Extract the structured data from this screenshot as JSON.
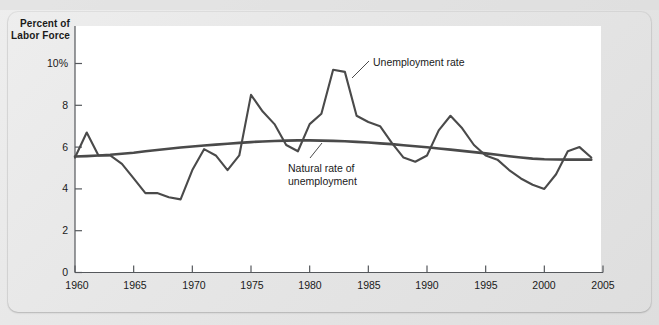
{
  "figure": {
    "axis_title_line1": "Percent of",
    "axis_title_line2": "Labor Force",
    "accent_line_color": "#4a4a4a",
    "panel_color": "#ffffff",
    "page_color": "#e9e9e9"
  },
  "labels": {
    "unemployment_rate": "Unemployment rate",
    "natural_rate": "Natural rate of\nunemployment"
  },
  "chart_data": {
    "type": "line",
    "title": "",
    "subtitle": "",
    "xlabel": "",
    "ylabel": "Percent of Labor Force",
    "xlim": [
      1960,
      2005
    ],
    "ylim": [
      0,
      10.8
    ],
    "grid": false,
    "legend": "inline-annotations",
    "ytick_labels": [
      "0",
      "2",
      "4",
      "6",
      "8",
      "10%"
    ],
    "ytick_values": [
      0,
      2,
      4,
      6,
      8,
      10
    ],
    "xtick_labels": [
      "1960",
      "1965",
      "1970",
      "1975",
      "1980",
      "1985",
      "1990",
      "1995",
      "2000",
      "2005"
    ],
    "xtick_values": [
      1960,
      1965,
      1970,
      1975,
      1980,
      1985,
      1990,
      1995,
      2000,
      2005
    ],
    "x": [
      1960,
      1961,
      1962,
      1963,
      1964,
      1965,
      1966,
      1967,
      1968,
      1969,
      1970,
      1971,
      1972,
      1973,
      1974,
      1975,
      1976,
      1977,
      1978,
      1979,
      1980,
      1981,
      1982,
      1983,
      1984,
      1985,
      1986,
      1987,
      1988,
      1989,
      1990,
      1991,
      1992,
      1993,
      1994,
      1995,
      1996,
      1997,
      1998,
      1999,
      2000,
      2001,
      2002,
      2003,
      2004
    ],
    "series": [
      {
        "name": "Unemployment rate",
        "color": "#4a4a4a",
        "values": [
          5.5,
          6.7,
          5.6,
          5.6,
          5.2,
          4.5,
          3.8,
          3.8,
          3.6,
          3.5,
          4.9,
          5.9,
          5.6,
          4.9,
          5.6,
          8.5,
          7.7,
          7.1,
          6.1,
          5.8,
          7.1,
          7.6,
          9.7,
          9.6,
          7.5,
          7.2,
          7.0,
          6.2,
          5.5,
          5.3,
          5.6,
          6.8,
          7.5,
          6.9,
          6.1,
          5.6,
          5.4,
          4.9,
          4.5,
          4.2,
          4.0,
          4.7,
          5.8,
          6.0,
          5.5
        ]
      },
      {
        "name": "Natural rate of unemployment",
        "color": "#4a4a4a",
        "values": [
          5.55,
          5.57,
          5.6,
          5.63,
          5.68,
          5.73,
          5.8,
          5.86,
          5.92,
          5.98,
          6.03,
          6.08,
          6.12,
          6.16,
          6.2,
          6.24,
          6.27,
          6.29,
          6.31,
          6.32,
          6.32,
          6.31,
          6.3,
          6.28,
          6.25,
          6.22,
          6.18,
          6.14,
          6.09,
          6.04,
          5.99,
          5.93,
          5.88,
          5.82,
          5.76,
          5.7,
          5.63,
          5.56,
          5.5,
          5.45,
          5.42,
          5.41,
          5.4,
          5.4,
          5.4
        ]
      }
    ],
    "annotations": [
      {
        "text": "Unemployment rate",
        "points_to_year": 1983,
        "points_to_value": 9.6
      },
      {
        "text": "Natural rate of unemployment",
        "points_to_year": 1980,
        "points_to_value": 6.3
      }
    ]
  }
}
